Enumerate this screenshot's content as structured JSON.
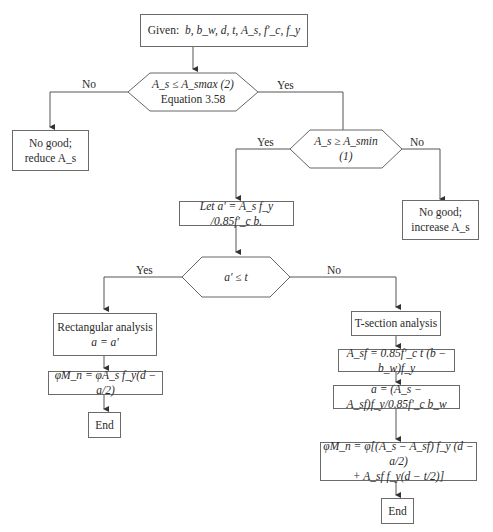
{
  "flowchart": {
    "start": {
      "label": "Given:",
      "text": "b, b_w, d, t, A_s, f'_c, f_y"
    },
    "decision_max": {
      "line1": "A_s ≤ A_smax (2)",
      "line2": "Equation 3.58"
    },
    "no_good_reduce": {
      "line1": "No good;",
      "line2": "reduce A_s"
    },
    "decision_min": {
      "text": "A_s ≥ A_smin (1)"
    },
    "no_good_increase": {
      "line1": "No good;",
      "line2": "increase A_s"
    },
    "let_a": {
      "text": "Let a' = A_s f_y /0.85f'_c b."
    },
    "decision_t": {
      "text": "a' ≤ t"
    },
    "rect_analysis": {
      "line1": "Rectangular analysis",
      "line2": "a = a'"
    },
    "rect_moment": {
      "text": "φM_n = φA_s f_y(d − a/2)"
    },
    "rect_end": {
      "text": "End"
    },
    "t_analysis": {
      "text": "T-section analysis"
    },
    "asf": {
      "text": "A_sf = 0.85f'_c t (b − b_w)f_y"
    },
    "a_eq": {
      "text": "a = (A_s − A_sf)f_y/0.85f'_c b_w"
    },
    "t_moment": {
      "line1": "φM_n = φ[(A_s − A_sf) f_y (d − a/2)",
      "line2": "+ A_sf f_y(d − t/2)]"
    },
    "t_end": {
      "text": "End"
    },
    "edge_labels": {
      "max_no": "No",
      "max_yes": "Yes",
      "min_yes": "Yes",
      "min_no": "No",
      "t_yes": "Yes",
      "t_no": "No"
    },
    "colors": {
      "line": "#555555",
      "text": "#2a2a2a",
      "border": "#6a6a6a"
    }
  }
}
